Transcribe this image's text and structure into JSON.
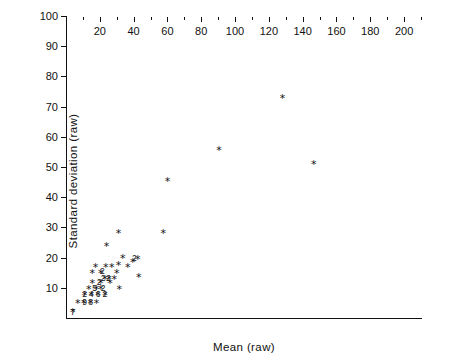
{
  "chart_data": {
    "type": "scatter",
    "title": "",
    "xlabel": "Mean (raw)",
    "ylabel": "Standard deviation  (raw)",
    "xlim": [
      0,
      210
    ],
    "ylim": [
      0,
      100
    ],
    "xticks": [
      20,
      40,
      60,
      80,
      100,
      120,
      140,
      160,
      180,
      200
    ],
    "xticks_minor": [
      10,
      30,
      50,
      70,
      90,
      110,
      130,
      150,
      170,
      190,
      210
    ],
    "yticks": [
      10,
      20,
      30,
      40,
      50,
      60,
      70,
      80,
      90,
      100
    ],
    "grid": false,
    "legend": null,
    "marker": "*",
    "marker_color": "#111111",
    "overplot_note": "Digits next to markers indicate the number of coincident observations at that location.",
    "points": [
      {
        "x": 128.0,
        "y": 73.0,
        "n": 1
      },
      {
        "x": 146.5,
        "y": 51.0,
        "n": 1
      },
      {
        "x": 90.5,
        "y": 55.5,
        "n": 1
      },
      {
        "x": 60.0,
        "y": 45.5,
        "n": 1
      },
      {
        "x": 57.5,
        "y": 28.0,
        "n": 1
      },
      {
        "x": 31.0,
        "y": 28.0,
        "n": 1
      },
      {
        "x": 24.0,
        "y": 24.0,
        "n": 1
      },
      {
        "x": 33.5,
        "y": 20.0,
        "n": 1
      },
      {
        "x": 42.5,
        "y": 19.5,
        "n": 1
      },
      {
        "x": 39.5,
        "y": 18.5,
        "n": 2
      },
      {
        "x": 17.5,
        "y": 17.0,
        "n": 1
      },
      {
        "x": 23.5,
        "y": 17.0,
        "n": 1
      },
      {
        "x": 27.0,
        "y": 17.0,
        "n": 1
      },
      {
        "x": 31.0,
        "y": 17.5,
        "n": 1
      },
      {
        "x": 36.5,
        "y": 17.0,
        "n": 1
      },
      {
        "x": 15.5,
        "y": 15.0,
        "n": 1
      },
      {
        "x": 20.5,
        "y": 15.0,
        "n": 2
      },
      {
        "x": 30.0,
        "y": 15.0,
        "n": 1
      },
      {
        "x": 43.0,
        "y": 13.5,
        "n": 1
      },
      {
        "x": 23.0,
        "y": 13.0,
        "n": 2
      },
      {
        "x": 25.5,
        "y": 13.0,
        "n": 2
      },
      {
        "x": 28.5,
        "y": 13.0,
        "n": 1
      },
      {
        "x": 15.5,
        "y": 11.5,
        "n": 1
      },
      {
        "x": 20.5,
        "y": 11.5,
        "n": 2
      },
      {
        "x": 26.0,
        "y": 11.5,
        "n": 1
      },
      {
        "x": 13.5,
        "y": 9.5,
        "n": 1
      },
      {
        "x": 18.0,
        "y": 9.5,
        "n": 1
      },
      {
        "x": 20.5,
        "y": 9.5,
        "n": 1
      },
      {
        "x": 31.5,
        "y": 9.5,
        "n": 1
      },
      {
        "x": 11.0,
        "y": 7.5,
        "n": 2
      },
      {
        "x": 15.0,
        "y": 7.5,
        "n": 4
      },
      {
        "x": 19.0,
        "y": 7.5,
        "n": 6
      },
      {
        "x": 23.0,
        "y": 7.5,
        "n": 2
      },
      {
        "x": 7.0,
        "y": 5.0,
        "n": 1
      },
      {
        "x": 10.5,
        "y": 5.0,
        "n": 9
      },
      {
        "x": 14.5,
        "y": 5.0,
        "n": 8
      },
      {
        "x": 18.0,
        "y": 5.0,
        "n": 1
      },
      {
        "x": 4.0,
        "y": 2.0,
        "n": 7
      }
    ],
    "inline_count_labels": [
      {
        "x": 40.5,
        "y": 19.8,
        "text": "2"
      },
      {
        "x": 21.5,
        "y": 15.4,
        "text": "2"
      },
      {
        "x": 22.0,
        "y": 13.4,
        "text": "2"
      },
      {
        "x": 25.0,
        "y": 13.4,
        "text": "2"
      },
      {
        "x": 19.6,
        "y": 11.8,
        "text": "2"
      },
      {
        "x": 17.0,
        "y": 9.9,
        "text": "5"
      },
      {
        "x": 22.0,
        "y": 9.9,
        "text": "2"
      },
      {
        "x": 11.0,
        "y": 7.9,
        "text": "2"
      },
      {
        "x": 15.0,
        "y": 7.9,
        "text": "4"
      },
      {
        "x": 19.0,
        "y": 7.9,
        "text": "6"
      },
      {
        "x": 23.0,
        "y": 7.9,
        "text": "2"
      },
      {
        "x": 11.0,
        "y": 5.2,
        "text": "9"
      },
      {
        "x": 14.5,
        "y": 5.2,
        "text": "8"
      },
      {
        "x": 4.0,
        "y": 2.0,
        "text": "7"
      }
    ]
  }
}
